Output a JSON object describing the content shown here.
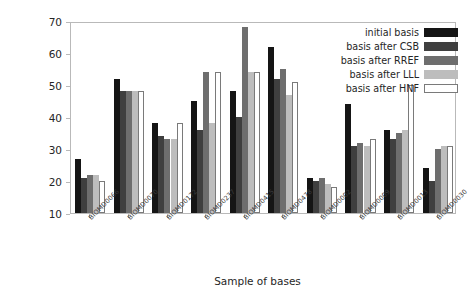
{
  "chart_data": {
    "type": "bar",
    "title": "",
    "xlabel": "Sample of bases",
    "ylabel": "Number of nonzero coefficients",
    "ylim": [
      10,
      70
    ],
    "yticks": [
      10,
      20,
      30,
      40,
      50,
      60,
      70
    ],
    "grid": false,
    "legend_position": "top-right",
    "categories": [
      "BIOMD0066",
      "BIOMD0070",
      "BIOMD0172",
      "BIOMD0237",
      "BIOMD0415",
      "BIOMD0478",
      "BIOMD0002",
      "BIOMD0009",
      "BIOMD0013",
      "BIOMD0030"
    ],
    "series": [
      {
        "name": "initial basis",
        "color": "#151515",
        "values": [
          27,
          52,
          38,
          45,
          48,
          62,
          21,
          44,
          36,
          24
        ]
      },
      {
        "name": "basis after CSB",
        "color": "#3f3f3f",
        "values": [
          21,
          48,
          34,
          36,
          40,
          52,
          20,
          31,
          33,
          20
        ]
      },
      {
        "name": "basis after RREF",
        "color": "#6e6e6e",
        "values": [
          22,
          48,
          33,
          54,
          68,
          55,
          21,
          32,
          35,
          30
        ]
      },
      {
        "name": "basis after LLL",
        "color": "#bdbdbd",
        "values": [
          22,
          48,
          33,
          38,
          54,
          47,
          19,
          31,
          36,
          31
        ]
      },
      {
        "name": "basis after HNF",
        "color": "#ffffff",
        "values": [
          20,
          48,
          38,
          54,
          54,
          51,
          18,
          33,
          50,
          31
        ]
      }
    ]
  },
  "legend": {
    "items": [
      {
        "label": "initial basis"
      },
      {
        "label": "basis after CSB"
      },
      {
        "label": "basis after RREF"
      },
      {
        "label": "basis after LLL"
      },
      {
        "label": "basis after HNF"
      }
    ]
  }
}
